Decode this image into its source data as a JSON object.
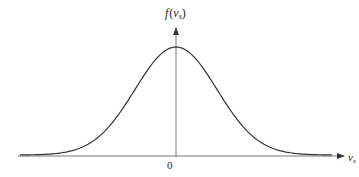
{
  "figure": {
    "type": "gaussian-distribution-diagram",
    "y_axis_label": {
      "main": "f",
      "open": "(",
      "var": "v",
      "sub": "s",
      "close": ")"
    },
    "x_axis_label": {
      "var": "v",
      "sub": "s"
    },
    "origin_label": "0",
    "colors": {
      "curve": "#333333",
      "axis": "#444444",
      "text": "#222222"
    }
  },
  "chart_data": {
    "type": "line",
    "title": "",
    "xlabel": "v_s",
    "ylabel": "f(v_s)",
    "center": 0,
    "x_ticks": [
      "0"
    ],
    "grid": false,
    "legend": null
  }
}
